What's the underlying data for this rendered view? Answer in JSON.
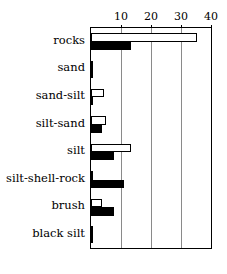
{
  "chart_data": {
    "type": "bar",
    "orientation": "horizontal",
    "title": "",
    "xlabel": "",
    "ylabel": "",
    "xlim": [
      0,
      40
    ],
    "ticks": [
      0,
      10,
      20,
      30,
      40
    ],
    "tick_labels": [
      "",
      "10",
      "20",
      "30",
      "40"
    ],
    "grid": true,
    "legend": "none",
    "categories": [
      "rocks",
      "sand",
      "sand-silt",
      "silt-sand",
      "silt",
      "silt-shell-rock",
      "brush",
      "black silt"
    ],
    "series": [
      {
        "name": "open",
        "style": "white-fill-black-outline",
        "values": [
          35.0,
          0.0,
          4.3,
          5.0,
          13.3,
          0.6,
          3.6,
          0.5
        ]
      },
      {
        "name": "filled",
        "style": "black-fill",
        "values": [
          13.2,
          0.6,
          0.5,
          3.6,
          7.5,
          11.0,
          7.5,
          0.5
        ]
      }
    ]
  },
  "axis": {
    "tick_10": "10",
    "tick_20": "20",
    "tick_30": "30",
    "tick_40": "40"
  },
  "colors": {
    "open_fill": "#ffffff",
    "filled_fill": "#000000",
    "outline": "#000000",
    "grid": "#8a8a8a",
    "background": "#ffffff"
  }
}
